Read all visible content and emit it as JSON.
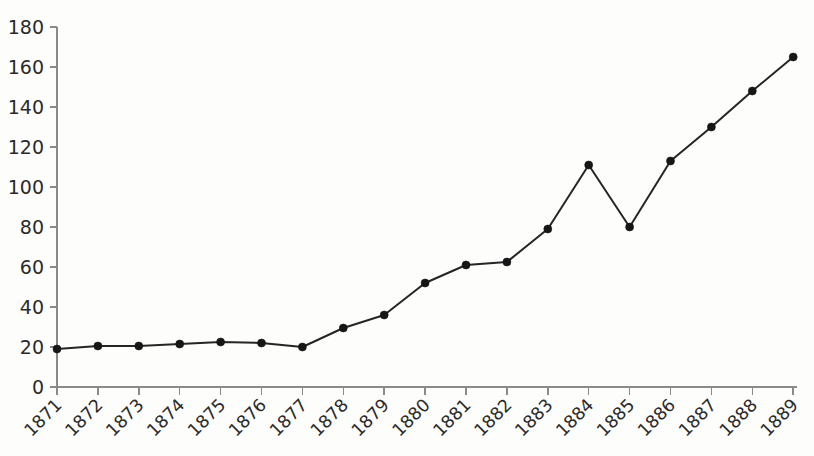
{
  "chart_data": {
    "type": "line",
    "title": "",
    "subtitle": "",
    "xlabel": "",
    "ylabel": "",
    "categories": [
      "1871",
      "1872",
      "1873",
      "1874",
      "1875",
      "1876",
      "1877",
      "1878",
      "1879",
      "1880",
      "1881",
      "1882",
      "1883",
      "1884",
      "1885",
      "1886",
      "1887",
      "1888",
      "1889"
    ],
    "values": [
      19,
      20.5,
      20.5,
      21.5,
      22.5,
      22,
      20,
      29.5,
      36,
      52,
      61,
      62.5,
      79,
      111,
      80,
      113,
      130,
      148,
      165
    ],
    "series": [
      {
        "name": "series-1",
        "values": [
          19,
          20.5,
          20.5,
          21.5,
          22.5,
          22,
          20,
          29.5,
          36,
          52,
          61,
          62.5,
          79,
          111,
          80,
          113,
          130,
          148,
          165
        ]
      }
    ],
    "ylim": [
      0,
      180
    ],
    "ytick_labels": [
      "0",
      "20",
      "40",
      "60",
      "80",
      "100",
      "120",
      "140",
      "160",
      "180"
    ],
    "ytick_values": [
      0,
      20,
      40,
      60,
      80,
      100,
      120,
      140,
      160,
      180
    ],
    "xtick_labels": [
      "1871",
      "1872",
      "1873",
      "1874",
      "1875",
      "1876",
      "1877",
      "1878",
      "1879",
      "1880",
      "1881",
      "1882",
      "1883",
      "1884",
      "1885",
      "1886",
      "1887",
      "1888",
      "1889"
    ],
    "grid": false,
    "legend": false,
    "legend_position": "none",
    "xtick_label_rotation_deg": -45,
    "marker": "circle",
    "colors": {
      "line": "#252525",
      "marker": "#161616",
      "axis": "#8a8a8a",
      "tick_text": "#2b2b2b",
      "background": "#fdfdfc"
    },
    "annotations": []
  }
}
